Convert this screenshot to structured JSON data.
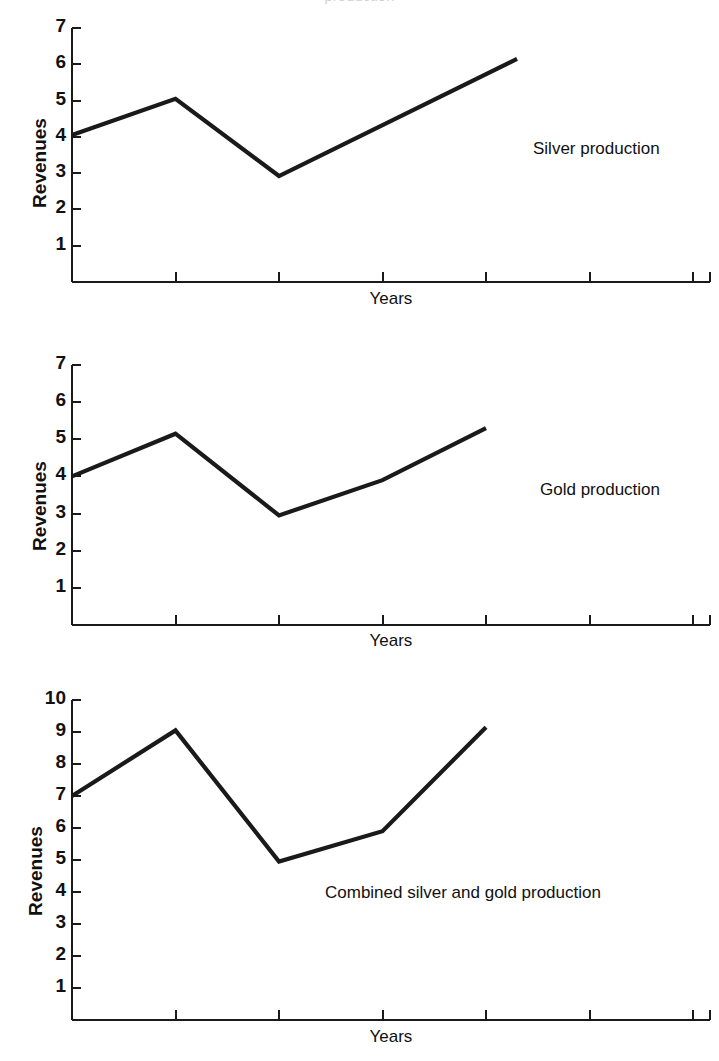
{
  "figure": {
    "cropped_top_text": "production",
    "background_color": "#ffffff",
    "line_color": "#1a1a1a",
    "axis_color": "#1a1a1a"
  },
  "chart_data": [
    {
      "type": "line",
      "title": "",
      "annotation": "Silver production",
      "xlabel": "Years",
      "ylabel": "Revenues",
      "ytick_labels": [
        "1",
        "2",
        "3",
        "4",
        "5",
        "6",
        "7"
      ],
      "yticks": [
        1,
        2,
        3,
        4,
        5,
        6,
        7
      ],
      "ylim": [
        0,
        7
      ],
      "xlim": [
        0,
        6
      ],
      "xtick_labels": [
        "",
        "",
        "",
        "",
        "",
        "",
        ""
      ],
      "grid": false,
      "legend_position": "inside-right",
      "x": [
        0,
        1,
        2,
        4.3
      ],
      "values": [
        4.05,
        5.05,
        2.92,
        6.15
      ]
    },
    {
      "type": "line",
      "title": "",
      "annotation": "Gold production",
      "xlabel": "Years",
      "ylabel": "Revenues",
      "ytick_labels": [
        "1",
        "2",
        "3",
        "4",
        "5",
        "6",
        "7"
      ],
      "yticks": [
        1,
        2,
        3,
        4,
        5,
        6,
        7
      ],
      "ylim": [
        0,
        7
      ],
      "xlim": [
        0,
        6
      ],
      "xtick_labels": [
        "",
        "",
        "",
        "",
        "",
        "",
        ""
      ],
      "grid": false,
      "legend_position": "inside-right",
      "x": [
        0,
        1,
        2,
        3,
        4
      ],
      "values": [
        4.0,
        5.15,
        2.95,
        3.9,
        5.3
      ]
    },
    {
      "type": "line",
      "title": "",
      "annotation": "Combined silver and gold production",
      "xlabel": "Years",
      "ylabel": "Revenues",
      "ytick_labels": [
        "1",
        "2",
        "3",
        "4",
        "5",
        "6",
        "7",
        "8",
        "9",
        "10"
      ],
      "yticks": [
        1,
        2,
        3,
        4,
        5,
        6,
        7,
        8,
        9,
        10
      ],
      "ylim": [
        0,
        10
      ],
      "xlim": [
        0,
        6
      ],
      "xtick_labels": [
        "",
        "",
        "",
        "",
        "",
        "",
        ""
      ],
      "grid": false,
      "legend_position": "inside-center",
      "x": [
        0,
        1,
        2,
        3,
        4
      ],
      "values": [
        7.0,
        9.05,
        4.95,
        5.9,
        9.15
      ]
    }
  ]
}
